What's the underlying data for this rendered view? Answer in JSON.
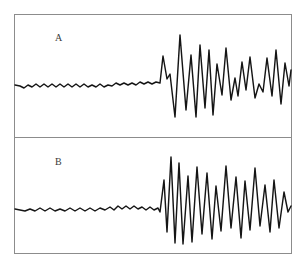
{
  "figure": {
    "background_color": "#ffffff",
    "frame_color": "#8c8c8c",
    "trace_color": "#151515",
    "width": 306,
    "height": 270
  },
  "panels": [
    {
      "id": "A",
      "label": "A",
      "frame": {
        "x": 14,
        "y": 14,
        "width": 278,
        "height": 124
      },
      "label_position": {
        "x": 55,
        "y": 33
      },
      "baseline_y": 85,
      "burst_onset_x": 160,
      "description": "quiet low-amplitude baseline followed by high-amplitude oscillatory burst"
    },
    {
      "id": "B",
      "label": "B",
      "frame": {
        "x": 14,
        "y": 137,
        "width": 278,
        "height": 117
      },
      "label_position": {
        "x": 55,
        "y": 157
      },
      "baseline_y": 209,
      "burst_onset_x": 160,
      "description": "quiet low-amplitude baseline followed by broad high-amplitude oscillatory burst"
    }
  ],
  "chart_data": {
    "type": "line",
    "title": "",
    "xlabel": "",
    "ylabel": "",
    "grid": false,
    "legend": "none",
    "series": [
      {
        "name": "A",
        "panel": "A",
        "stroke": "#151515",
        "baseline_y": 85,
        "xlim": [
          15,
          291
        ],
        "ylim": [
          15,
          137
        ],
        "points": [
          [
            15,
            85
          ],
          [
            20,
            86
          ],
          [
            24,
            88
          ],
          [
            28,
            85
          ],
          [
            32,
            87
          ],
          [
            36,
            84
          ],
          [
            40,
            87
          ],
          [
            44,
            84
          ],
          [
            48,
            87
          ],
          [
            52,
            84
          ],
          [
            56,
            87
          ],
          [
            60,
            84
          ],
          [
            64,
            87
          ],
          [
            68,
            84
          ],
          [
            72,
            87
          ],
          [
            76,
            84
          ],
          [
            80,
            87
          ],
          [
            84,
            84
          ],
          [
            88,
            87
          ],
          [
            92,
            85
          ],
          [
            96,
            87
          ],
          [
            100,
            84
          ],
          [
            104,
            87
          ],
          [
            108,
            85
          ],
          [
            112,
            86
          ],
          [
            116,
            83
          ],
          [
            120,
            85
          ],
          [
            124,
            83
          ],
          [
            128,
            85
          ],
          [
            132,
            83
          ],
          [
            136,
            85
          ],
          [
            140,
            82
          ],
          [
            144,
            84
          ],
          [
            148,
            82
          ],
          [
            152,
            84
          ],
          [
            156,
            82
          ],
          [
            160,
            83
          ],
          [
            163,
            56
          ],
          [
            167,
            79
          ],
          [
            170,
            74
          ],
          [
            175,
            117
          ],
          [
            180,
            35
          ],
          [
            186,
            110
          ],
          [
            191,
            55
          ],
          [
            196,
            117
          ],
          [
            200,
            45
          ],
          [
            205,
            108
          ],
          [
            209,
            50
          ],
          [
            213,
            115
          ],
          [
            217,
            64
          ],
          [
            222,
            95
          ],
          [
            226,
            48
          ],
          [
            231,
            100
          ],
          [
            235,
            78
          ],
          [
            238,
            96
          ],
          [
            242,
            62
          ],
          [
            246,
            90
          ],
          [
            250,
            57
          ],
          [
            255,
            98
          ],
          [
            259,
            84
          ],
          [
            263,
            92
          ],
          [
            267,
            58
          ],
          [
            272,
            96
          ],
          [
            276,
            50
          ],
          [
            281,
            104
          ],
          [
            285,
            63
          ],
          [
            289,
            86
          ],
          [
            291,
            70
          ]
        ]
      },
      {
        "name": "B",
        "panel": "B",
        "stroke": "#151515",
        "baseline_y": 209,
        "xlim": [
          15,
          291
        ],
        "ylim": [
          138,
          253
        ],
        "points": [
          [
            15,
            209
          ],
          [
            20,
            210
          ],
          [
            25,
            211
          ],
          [
            30,
            209
          ],
          [
            35,
            211
          ],
          [
            40,
            208
          ],
          [
            45,
            211
          ],
          [
            50,
            208
          ],
          [
            55,
            211
          ],
          [
            60,
            209
          ],
          [
            65,
            211
          ],
          [
            70,
            208
          ],
          [
            75,
            211
          ],
          [
            80,
            208
          ],
          [
            85,
            211
          ],
          [
            90,
            208
          ],
          [
            95,
            211
          ],
          [
            100,
            208
          ],
          [
            105,
            210
          ],
          [
            110,
            207
          ],
          [
            114,
            210
          ],
          [
            118,
            206
          ],
          [
            122,
            209
          ],
          [
            126,
            206
          ],
          [
            130,
            209
          ],
          [
            134,
            206
          ],
          [
            138,
            209
          ],
          [
            142,
            207
          ],
          [
            146,
            210
          ],
          [
            150,
            207
          ],
          [
            154,
            210
          ],
          [
            158,
            208
          ],
          [
            160,
            212
          ],
          [
            164,
            180
          ],
          [
            167,
            232
          ],
          [
            171,
            157
          ],
          [
            175,
            243
          ],
          [
            179,
            163
          ],
          [
            183,
            244
          ],
          [
            188,
            176
          ],
          [
            192,
            242
          ],
          [
            197,
            167
          ],
          [
            202,
            234
          ],
          [
            207,
            173
          ],
          [
            212,
            239
          ],
          [
            216,
            186
          ],
          [
            221,
            231
          ],
          [
            226,
            166
          ],
          [
            231,
            228
          ],
          [
            236,
            177
          ],
          [
            241,
            238
          ],
          [
            245,
            181
          ],
          [
            250,
            230
          ],
          [
            255,
            168
          ],
          [
            260,
            226
          ],
          [
            265,
            185
          ],
          [
            270,
            232
          ],
          [
            274,
            180
          ],
          [
            279,
            228
          ],
          [
            284,
            192
          ],
          [
            288,
            212
          ],
          [
            291,
            206
          ]
        ]
      }
    ]
  }
}
